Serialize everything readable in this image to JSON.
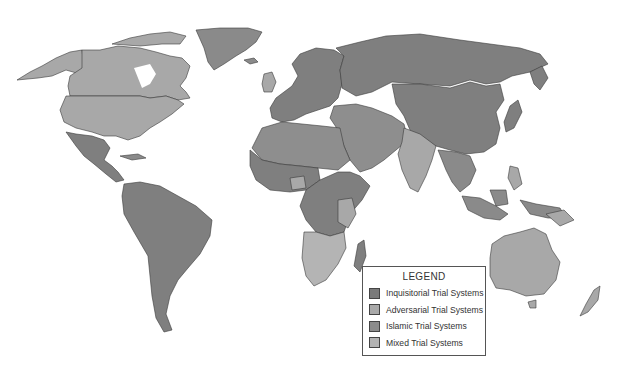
{
  "map": {
    "title": "World Trial Systems Map",
    "colors": {
      "inquisitorial": "#7f7f7f",
      "adversarial": "#a8a8a8",
      "islamic": "#8e8e8e",
      "mixed": "#b4b4b4",
      "border": "#3a3a3a",
      "water": "#ffffff"
    },
    "regions": [
      {
        "name": "Alaska",
        "category": "adversarial"
      },
      {
        "name": "Canada",
        "category": "adversarial"
      },
      {
        "name": "United States",
        "category": "adversarial"
      },
      {
        "name": "Greenland",
        "category": "inquisitorial"
      },
      {
        "name": "Mexico & Central America",
        "category": "inquisitorial"
      },
      {
        "name": "South America",
        "category": "inquisitorial"
      },
      {
        "name": "Europe",
        "category": "inquisitorial"
      },
      {
        "name": "United Kingdom",
        "category": "adversarial"
      },
      {
        "name": "Russia",
        "category": "inquisitorial"
      },
      {
        "name": "China",
        "category": "inquisitorial"
      },
      {
        "name": "Middle East",
        "category": "islamic"
      },
      {
        "name": "North Africa",
        "category": "islamic"
      },
      {
        "name": "Central Africa",
        "category": "inquisitorial"
      },
      {
        "name": "Southern Africa",
        "category": "mixed"
      },
      {
        "name": "India",
        "category": "adversarial"
      },
      {
        "name": "Southeast Asia",
        "category": "inquisitorial"
      },
      {
        "name": "Japan",
        "category": "inquisitorial"
      },
      {
        "name": "Australia",
        "category": "adversarial"
      },
      {
        "name": "New Zealand",
        "category": "adversarial"
      },
      {
        "name": "Madagascar",
        "category": "inquisitorial"
      }
    ]
  },
  "legend": {
    "title": "LEGEND",
    "items": [
      {
        "label": "Inquisitorial Trial Systems",
        "color": "#7a7a7a"
      },
      {
        "label": "Adversarial Trial Systems",
        "color": "#a9a9a9"
      },
      {
        "label": "Islamic Trial Systems",
        "color": "#8c8c8c"
      },
      {
        "label": "Mixed Trial Systems",
        "color": "#b3b3b3"
      }
    ]
  }
}
